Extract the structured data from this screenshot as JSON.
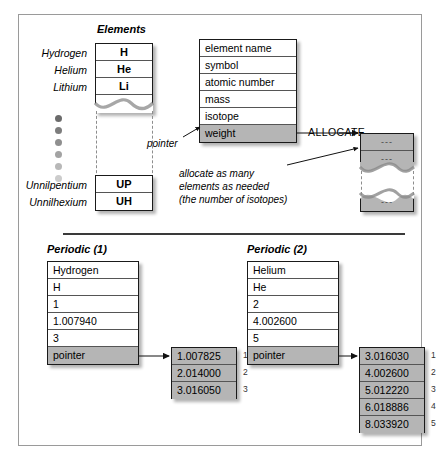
{
  "figure": {
    "elements_table": {
      "caption": "Elements",
      "top_rows": [
        {
          "label": "Hydrogen",
          "symbol": "H"
        },
        {
          "label": "Helium",
          "symbol": "He"
        },
        {
          "label": "Lithium",
          "symbol": "Li"
        }
      ],
      "bottom_rows": [
        {
          "label": "Unnilpentium",
          "symbol": "UP"
        },
        {
          "label": "Unnilhexium",
          "symbol": "UH"
        }
      ],
      "ellipsis_dots": 6
    },
    "record_table": {
      "fields": [
        "element name",
        "symbol",
        "atomic number",
        "mass",
        "isotope",
        "weight"
      ],
      "highlighted_field": "weight"
    },
    "allocate": {
      "label": "ALLOCATE",
      "cells": [
        "---",
        "---",
        "---"
      ]
    },
    "annotations": {
      "pointer": "pointer",
      "allocate_note": [
        "allocate as many",
        "elements as needed",
        "(the number of isotopes)"
      ]
    },
    "periodic_1": {
      "caption": "Periodic (1)",
      "fields": [
        "Hydrogen",
        "H",
        "1",
        "1.007940",
        "3"
      ],
      "pointer_label": "pointer",
      "isotopes": [
        "1.007825",
        "2.014000",
        "3.016050"
      ],
      "indices": [
        "1",
        "2",
        "3"
      ]
    },
    "periodic_2": {
      "caption": "Periodic (2)",
      "fields": [
        "Helium",
        "He",
        "2",
        "4.002600",
        "5"
      ],
      "pointer_label": "pointer",
      "isotopes": [
        "3.016030",
        "4.002600",
        "5.012220",
        "6.018886",
        "8.033920"
      ],
      "indices": [
        "1",
        "2",
        "3",
        "4",
        "5"
      ]
    },
    "colors": {
      "highlight_gray": "#b5b5b5",
      "border_dark": "#1a1a1a",
      "rule": "#3a3a3a"
    }
  }
}
